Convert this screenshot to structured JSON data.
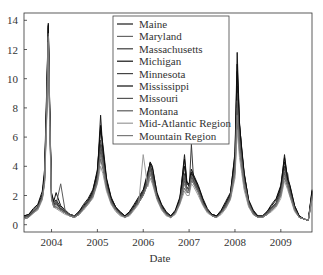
{
  "chart_data": {
    "type": "line",
    "title": "",
    "xlabel": "Date",
    "ylabel": "",
    "xlim": [
      2003.4,
      2009.68
    ],
    "ylim": [
      -0.5,
      14.5
    ],
    "x_ticks": [
      2004,
      2005,
      2006,
      2007,
      2008,
      2009
    ],
    "x_tick_labels": [
      "2004",
      "2005",
      "2006",
      "2007",
      "2008",
      "2009"
    ],
    "y_ticks": [
      0,
      2,
      4,
      6,
      8,
      10,
      12,
      14
    ],
    "y_tick_labels": [
      "0",
      "2",
      "4",
      "6",
      "8",
      "10",
      "12",
      "14"
    ],
    "grid": false,
    "legend_position": "upper center",
    "x": [
      2003.4,
      2003.5,
      2003.6,
      2003.7,
      2003.8,
      2003.85,
      2003.9,
      2003.93,
      2003.96,
      2004.0,
      2004.05,
      2004.1,
      2004.2,
      2004.3,
      2004.4,
      2004.5,
      2004.6,
      2004.7,
      2004.8,
      2004.9,
      2005.0,
      2005.07,
      2005.12,
      2005.2,
      2005.3,
      2005.4,
      2005.5,
      2005.6,
      2005.7,
      2005.8,
      2005.9,
      2006.0,
      2006.1,
      2006.15,
      2006.2,
      2006.3,
      2006.4,
      2006.5,
      2006.6,
      2006.7,
      2006.8,
      2006.9,
      2006.95,
      2007.0,
      2007.05,
      2007.1,
      2007.2,
      2007.3,
      2007.4,
      2007.5,
      2007.6,
      2007.7,
      2007.8,
      2007.9,
      2008.0,
      2008.05,
      2008.1,
      2008.15,
      2008.2,
      2008.3,
      2008.4,
      2008.5,
      2008.6,
      2008.7,
      2008.8,
      2008.9,
      2009.0,
      2009.08,
      2009.15,
      2009.2,
      2009.3,
      2009.4,
      2009.5,
      2009.6,
      2009.68
    ],
    "series": [
      {
        "name": "Maine",
        "color": "#1a1a1a",
        "values": [
          0.5,
          0.6,
          0.9,
          1.2,
          2.0,
          3.5,
          9.0,
          13.8,
          8.0,
          2.0,
          1.4,
          1.5,
          1.1,
          0.9,
          0.7,
          0.6,
          0.8,
          1.2,
          1.6,
          2.2,
          3.5,
          7.5,
          5.0,
          3.0,
          1.8,
          1.2,
          0.8,
          0.6,
          0.8,
          1.2,
          1.7,
          2.2,
          3.5,
          4.2,
          3.5,
          2.0,
          1.3,
          0.8,
          0.6,
          0.9,
          1.7,
          4.8,
          3.0,
          2.6,
          3.5,
          3.2,
          2.5,
          1.6,
          1.0,
          0.7,
          0.6,
          0.9,
          1.4,
          2.0,
          5.0,
          11.8,
          7.0,
          5.0,
          3.5,
          1.6,
          0.9,
          0.5,
          0.5,
          0.8,
          1.2,
          1.5,
          2.5,
          4.8,
          3.0,
          2.5,
          1.2,
          0.6,
          0.4,
          0.3,
          2.4
        ]
      },
      {
        "name": "Maryland",
        "color": "#666666",
        "values": [
          0.4,
          0.5,
          0.8,
          1.1,
          1.8,
          3.0,
          8.0,
          13.0,
          7.0,
          1.8,
          1.3,
          1.2,
          1.0,
          0.8,
          0.6,
          0.5,
          0.7,
          1.1,
          1.5,
          2.0,
          3.0,
          4.5,
          3.8,
          2.5,
          1.5,
          1.0,
          0.7,
          0.5,
          0.7,
          1.1,
          1.5,
          2.0,
          2.8,
          3.5,
          3.0,
          1.8,
          1.1,
          0.7,
          0.5,
          0.8,
          1.5,
          2.5,
          2.2,
          2.2,
          3.0,
          2.8,
          2.2,
          1.4,
          0.9,
          0.6,
          0.5,
          0.8,
          1.2,
          1.8,
          3.5,
          7.0,
          5.0,
          3.8,
          2.6,
          1.3,
          0.7,
          0.5,
          0.5,
          0.7,
          1.0,
          1.3,
          2.0,
          3.2,
          2.6,
          2.0,
          1.0,
          0.5,
          0.4,
          0.3,
          1.8
        ]
      },
      {
        "name": "Massachusetts",
        "color": "#3a3a3a",
        "values": [
          0.5,
          0.6,
          0.9,
          1.2,
          1.9,
          3.2,
          8.5,
          13.5,
          7.5,
          1.9,
          1.4,
          1.6,
          1.0,
          0.8,
          0.6,
          0.5,
          0.8,
          1.2,
          1.6,
          2.1,
          3.2,
          5.5,
          4.5,
          2.8,
          1.6,
          1.1,
          0.7,
          0.5,
          0.7,
          1.2,
          1.6,
          2.1,
          3.0,
          4.0,
          3.3,
          1.9,
          1.2,
          0.7,
          0.5,
          0.8,
          1.6,
          3.5,
          2.6,
          2.4,
          5.5,
          3.0,
          2.4,
          1.5,
          1.0,
          0.6,
          0.5,
          0.8,
          1.3,
          1.9,
          4.0,
          9.5,
          6.5,
          4.5,
          3.0,
          1.4,
          0.8,
          0.5,
          0.5,
          0.8,
          1.1,
          1.4,
          2.2,
          4.0,
          2.8,
          2.2,
          1.1,
          0.5,
          0.4,
          0.3,
          2.0
        ]
      },
      {
        "name": "Michigan",
        "color": "#111111",
        "values": [
          0.6,
          0.7,
          1.0,
          1.3,
          2.1,
          3.4,
          9.5,
          13.6,
          8.2,
          2.1,
          1.5,
          1.7,
          1.2,
          0.9,
          0.7,
          0.6,
          0.9,
          1.3,
          1.7,
          2.3,
          3.8,
          6.5,
          5.5,
          3.2,
          1.9,
          1.2,
          0.8,
          0.6,
          0.9,
          1.3,
          1.8,
          2.3,
          3.2,
          4.3,
          4.0,
          2.1,
          1.3,
          0.8,
          0.6,
          0.9,
          1.8,
          4.0,
          2.8,
          2.7,
          3.6,
          3.3,
          2.6,
          1.7,
          1.0,
          0.7,
          0.6,
          0.9,
          1.5,
          2.1,
          4.5,
          10.5,
          6.8,
          5.2,
          3.6,
          1.6,
          0.9,
          0.6,
          0.6,
          0.9,
          1.3,
          1.7,
          2.6,
          4.3,
          3.2,
          2.6,
          1.3,
          0.6,
          0.4,
          0.3,
          2.2
        ]
      },
      {
        "name": "Minnesota",
        "color": "#444444",
        "values": [
          0.5,
          0.6,
          0.9,
          1.2,
          2.0,
          3.2,
          8.8,
          13.2,
          7.8,
          2.0,
          1.4,
          1.4,
          1.1,
          0.9,
          0.7,
          0.6,
          0.8,
          1.2,
          1.6,
          2.1,
          3.3,
          5.8,
          4.8,
          2.9,
          1.7,
          1.1,
          0.8,
          0.6,
          0.8,
          1.2,
          1.7,
          2.2,
          3.3,
          4.1,
          3.4,
          2.0,
          1.2,
          0.8,
          0.6,
          0.9,
          1.6,
          3.2,
          2.5,
          2.5,
          3.3,
          3.0,
          2.4,
          1.5,
          1.0,
          0.7,
          0.6,
          0.9,
          1.4,
          2.0,
          4.2,
          9.0,
          6.2,
          4.6,
          3.2,
          1.5,
          0.8,
          0.5,
          0.5,
          0.8,
          1.2,
          1.5,
          2.3,
          3.8,
          3.5,
          2.4,
          1.2,
          0.6,
          0.4,
          0.3,
          2.1
        ]
      },
      {
        "name": "Mississippi",
        "color": "#0d0d0d",
        "values": [
          0.6,
          0.7,
          1.1,
          1.4,
          2.3,
          3.8,
          9.8,
          13.7,
          8.0,
          2.2,
          1.6,
          2.2,
          1.3,
          1.0,
          0.7,
          0.6,
          0.9,
          1.4,
          1.8,
          2.4,
          3.6,
          6.8,
          5.2,
          3.1,
          1.8,
          1.2,
          0.9,
          0.6,
          0.9,
          1.4,
          1.9,
          2.4,
          3.6,
          4.2,
          3.9,
          2.2,
          1.4,
          0.9,
          0.6,
          1.0,
          1.9,
          4.5,
          2.9,
          2.8,
          3.8,
          3.4,
          2.7,
          1.8,
          1.1,
          0.7,
          0.6,
          1.0,
          1.6,
          2.2,
          4.8,
          11.0,
          6.9,
          5.1,
          3.5,
          1.7,
          1.0,
          0.6,
          0.6,
          0.9,
          1.4,
          1.8,
          2.7,
          4.6,
          3.1,
          2.7,
          1.3,
          0.6,
          0.4,
          0.3,
          2.3
        ]
      },
      {
        "name": "Missouri",
        "color": "#555555",
        "values": [
          0.4,
          0.5,
          0.8,
          1.1,
          1.8,
          3.0,
          8.2,
          12.8,
          7.2,
          1.8,
          1.2,
          1.3,
          1.0,
          0.8,
          0.6,
          0.5,
          0.7,
          1.1,
          1.4,
          1.9,
          3.0,
          5.0,
          4.2,
          2.6,
          1.5,
          1.0,
          0.7,
          0.5,
          0.7,
          1.1,
          1.5,
          2.0,
          2.9,
          3.8,
          3.2,
          1.8,
          1.1,
          0.7,
          0.5,
          0.8,
          1.5,
          3.0,
          2.4,
          2.3,
          3.2,
          2.9,
          2.3,
          1.4,
          0.9,
          0.6,
          0.5,
          0.8,
          1.3,
          1.9,
          3.8,
          8.0,
          5.5,
          4.2,
          2.9,
          1.4,
          0.8,
          0.5,
          0.5,
          0.7,
          1.1,
          1.4,
          2.1,
          3.5,
          2.7,
          2.1,
          1.1,
          0.5,
          0.4,
          0.3,
          1.9
        ]
      },
      {
        "name": "Montana",
        "color": "#5a5a5a",
        "values": [
          0.5,
          0.6,
          0.9,
          1.2,
          1.9,
          3.1,
          8.6,
          13.1,
          7.6,
          1.9,
          1.3,
          1.4,
          2.8,
          0.9,
          0.7,
          0.6,
          0.8,
          1.2,
          1.5,
          2.0,
          3.1,
          5.2,
          4.4,
          2.7,
          1.6,
          1.1,
          0.7,
          0.5,
          0.7,
          1.1,
          1.6,
          2.1,
          3.0,
          3.9,
          3.3,
          1.9,
          1.2,
          0.7,
          0.5,
          0.8,
          1.6,
          3.3,
          2.5,
          2.4,
          3.4,
          3.1,
          2.4,
          1.5,
          1.0,
          0.6,
          0.5,
          0.8,
          1.3,
          1.9,
          4.0,
          8.5,
          5.8,
          4.4,
          3.0,
          1.5,
          0.8,
          0.5,
          0.5,
          0.8,
          1.1,
          1.4,
          2.2,
          3.6,
          2.8,
          2.2,
          1.1,
          0.5,
          0.4,
          0.3,
          2.0
        ]
      },
      {
        "name": "Mid-Atlantic Region",
        "color": "#9a9a9a",
        "values": [
          0.4,
          0.5,
          0.8,
          1.0,
          1.7,
          2.8,
          7.5,
          12.5,
          6.8,
          1.7,
          1.2,
          1.1,
          0.9,
          0.7,
          0.6,
          0.5,
          0.7,
          1.0,
          1.4,
          1.8,
          2.8,
          4.0,
          3.5,
          2.3,
          1.4,
          0.9,
          0.6,
          0.5,
          0.6,
          1.0,
          1.4,
          4.8,
          2.6,
          3.2,
          2.8,
          1.7,
          1.0,
          0.6,
          0.5,
          0.7,
          1.4,
          2.3,
          2.0,
          2.0,
          2.8,
          2.6,
          2.0,
          1.3,
          0.8,
          0.6,
          0.5,
          0.7,
          1.1,
          1.7,
          3.2,
          6.5,
          4.6,
          3.5,
          2.4,
          1.2,
          0.7,
          0.5,
          0.5,
          0.7,
          0.9,
          1.2,
          1.8,
          3.0,
          2.4,
          1.9,
          0.9,
          0.5,
          0.4,
          0.3,
          1.7
        ]
      },
      {
        "name": "Mountain Region",
        "color": "#7a7a7a",
        "values": [
          0.4,
          0.5,
          0.8,
          1.1,
          1.8,
          2.9,
          8.0,
          12.9,
          7.2,
          1.8,
          1.2,
          1.2,
          1.0,
          0.8,
          0.6,
          0.5,
          0.7,
          1.1,
          1.5,
          1.9,
          2.9,
          4.8,
          4.0,
          2.5,
          1.5,
          1.0,
          0.7,
          0.5,
          0.7,
          1.1,
          1.5,
          2.0,
          2.8,
          3.6,
          3.0,
          1.8,
          1.1,
          0.7,
          0.5,
          0.8,
          1.5,
          2.8,
          2.3,
          2.2,
          3.1,
          2.8,
          2.2,
          1.4,
          0.9,
          0.6,
          0.5,
          0.8,
          1.2,
          1.8,
          3.6,
          7.5,
          5.2,
          4.0,
          2.8,
          1.4,
          0.7,
          0.5,
          0.5,
          0.7,
          1.0,
          1.3,
          2.0,
          3.4,
          2.6,
          2.0,
          1.0,
          0.5,
          0.4,
          0.3,
          1.8
        ]
      }
    ]
  }
}
